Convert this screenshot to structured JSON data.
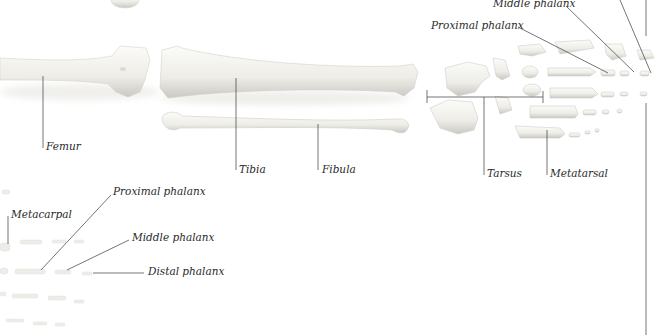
{
  "diagram": {
    "type": "anatomical-bone-illustration",
    "colors": {
      "background": "#ffffff",
      "bone_fill": "#f2f1ec",
      "bone_shadow": "#c9c8c2",
      "leader_line": "#3a3a3a",
      "label_text": "#2a2a2a"
    },
    "labels": {
      "femur": "Femur",
      "tibia": "Tibia",
      "fibula": "Fibula",
      "tarsus": "Tarsus",
      "metatarsal": "Metatarsal",
      "foot_proximal_phalanx": "Proximal phalanx",
      "foot_middle_phalanx": "Middle phalanx",
      "hand_metacarpal": "Metacarpal",
      "hand_proximal_phalanx": "Proximal phalanx",
      "hand_middle_phalanx": "Middle phalanx",
      "hand_distal_phalanx": "Distal phalanx"
    }
  }
}
